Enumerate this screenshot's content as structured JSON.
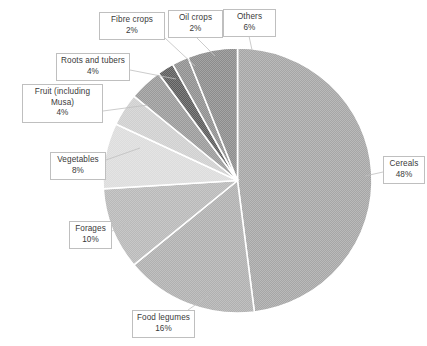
{
  "chart_data": {
    "type": "pie",
    "title": "",
    "subtitle": "",
    "xlabel": "",
    "ylabel": "",
    "legend_position": "none",
    "grid": false,
    "units": "percent",
    "start_angle_deg": 0,
    "direction": "clockwise",
    "categories": [
      "Cereals",
      "Food legumes",
      "Forages",
      "Vegetables",
      "Fruit (including Musa)",
      "Roots and tubers",
      "Fibre crops",
      "Oil crops",
      "Others"
    ],
    "values": [
      48,
      16,
      10,
      8,
      4,
      4,
      2,
      2,
      6
    ],
    "value_labels": [
      "48%",
      "16%",
      "10%",
      "8%",
      "4%",
      "4%",
      "2%",
      "2%",
      "6%"
    ],
    "colors": [
      "#a6a6a6",
      "#b0b0b0",
      "#b9b9b9",
      "#dcdcdc",
      "#cfcfcf",
      "#9a9a9a",
      "#5c5c5c",
      "#8f8f8f",
      "#8c8c8c"
    ],
    "slice_border_color": "#ffffff",
    "callout_border_color": "#bfbfbf",
    "text_color": "#3a3a3a"
  },
  "slices": [
    {
      "id": "cereals",
      "label": "Cereals",
      "percent_label": "48%",
      "value": 48,
      "color": "#a6a6a6",
      "start_deg": 0.0,
      "end_deg": 172.8
    },
    {
      "id": "food-legumes",
      "label": "Food legumes",
      "percent_label": "16%",
      "value": 16,
      "color": "#b0b0b0",
      "start_deg": 172.8,
      "end_deg": 230.4
    },
    {
      "id": "forages",
      "label": "Forages",
      "percent_label": "10%",
      "value": 10,
      "color": "#b9b9b9",
      "start_deg": 230.4,
      "end_deg": 266.4
    },
    {
      "id": "vegetables",
      "label": "Vegetables",
      "percent_label": "8%",
      "value": 8,
      "color": "#dcdcdc",
      "start_deg": 266.4,
      "end_deg": 295.2
    },
    {
      "id": "fruit",
      "label": "Fruit (including Musa)",
      "percent_label": "4%",
      "value": 4,
      "color": "#cfcfcf",
      "start_deg": 295.2,
      "end_deg": 309.6
    },
    {
      "id": "roots-tubers",
      "label": "Roots and tubers",
      "percent_label": "4%",
      "value": 4,
      "color": "#9a9a9a",
      "start_deg": 309.6,
      "end_deg": 324.0
    },
    {
      "id": "fibre-crops",
      "label": "Fibre crops",
      "percent_label": "2%",
      "value": 2,
      "color": "#5c5c5c",
      "start_deg": 324.0,
      "end_deg": 331.2
    },
    {
      "id": "oil-crops",
      "label": "Oil crops",
      "percent_label": "2%",
      "value": 2,
      "color": "#8f8f8f",
      "start_deg": 331.2,
      "end_deg": 338.4
    },
    {
      "id": "others",
      "label": "Others",
      "percent_label": "6%",
      "value": 6,
      "color": "#8c8c8c",
      "start_deg": 338.4,
      "end_deg": 360.0
    }
  ],
  "callouts": {
    "fibre_crops": {
      "label": "Fibre crops",
      "percent": "2%"
    },
    "oil_crops": {
      "label": "Oil crops",
      "percent": "2%"
    },
    "others": {
      "label": "Others",
      "percent": "6%"
    },
    "roots_tubers": {
      "label": "Roots and tubers",
      "percent": "4%"
    },
    "fruit": {
      "label": "Fruit (including Musa)",
      "percent": "4%"
    },
    "vegetables": {
      "label": "Vegetables",
      "percent": "8%"
    },
    "forages": {
      "label": "Forages",
      "percent": "10%"
    },
    "food_legumes": {
      "label": "Food legumes",
      "percent": "16%"
    },
    "cereals": {
      "label": "Cereals",
      "percent": "48%"
    }
  }
}
